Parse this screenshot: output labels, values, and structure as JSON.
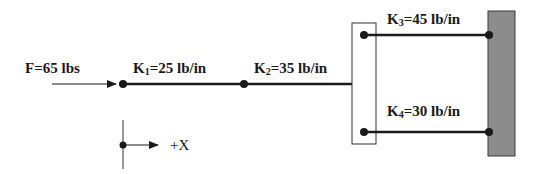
{
  "diagram": {
    "force": {
      "label": "F=65 lbs",
      "value": 65,
      "unit": "lbs",
      "direction": "+X"
    },
    "springs": [
      {
        "id": "k1",
        "label_main": "K",
        "subscript": "1",
        "label_rest": "=25 lb/in",
        "stiffness": 25,
        "unit": "lb/in"
      },
      {
        "id": "k2",
        "label_main": "K",
        "subscript": "2",
        "label_rest": "=35 lb/in",
        "stiffness": 35,
        "unit": "lb/in"
      },
      {
        "id": "k3",
        "label_main": "K",
        "subscript": "3",
        "label_rest": "=45 lb/in",
        "stiffness": 45,
        "unit": "lb/in"
      },
      {
        "id": "k4",
        "label_main": "K",
        "subscript": "4",
        "label_rest": "=30 lb/in",
        "stiffness": 30,
        "unit": "lb/in"
      }
    ],
    "axis": {
      "label": "+X"
    },
    "colors": {
      "line": "#1a1a1a",
      "wall_fill": "#8c8c8c",
      "wall_stroke": "#3a3a3a",
      "box_stroke": "#333333"
    }
  }
}
